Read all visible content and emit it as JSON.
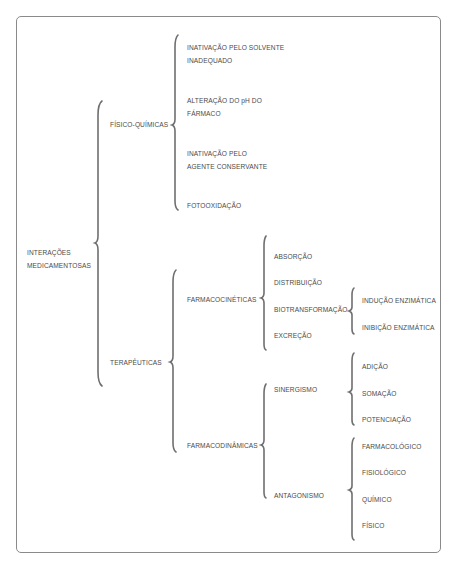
{
  "diagram": {
    "root": {
      "line1": "INTERAÇÕES",
      "line2": "MEDICAMENTOSAS"
    },
    "fisico_quimicas": {
      "label": "FÍSICO-QUÍMICAS",
      "items": [
        {
          "line1": "INATIVAÇÃO PELO SOLVENTE",
          "line2": "INADEQUADO"
        },
        {
          "line1": "ALTERAÇÃO DO pH DO",
          "line2": "FÁRMACO"
        },
        {
          "line1": "INATIVAÇÃO PELO",
          "line2": "AGENTE CONSERVANTE"
        },
        {
          "line1": "FOTOOXIDAÇÃO"
        }
      ]
    },
    "terapeuticas": {
      "label": "TERAPÊUTICAS",
      "farmacocineticas": {
        "label": "FARMACOCINÉTICAS",
        "items": [
          "ABSORÇÃO",
          "DISTRIBUIÇÃO",
          "BIOTRANSFORMAÇÃO",
          "EXCREÇÃO"
        ],
        "biotransformacao_items": [
          "INDUÇÃO ENZIMÁTICA",
          "INIBIÇÃO ENZIMÁTICA"
        ]
      },
      "farmacodinamicas": {
        "label": "FARMACODINÂMICAS",
        "sinergismo": {
          "label": "SINERGISMO",
          "items": [
            "ADIÇÃO",
            "SOMAÇÃO",
            "POTENCIAÇÃO"
          ]
        },
        "antagonismo": {
          "label": "ANTAGONISMO",
          "items": [
            "FARMACOLÓGICO",
            "FISIOLÓGICO",
            "QUÍMICO",
            "FÍSICO"
          ]
        }
      }
    }
  },
  "colors": {
    "text": "#4a4a4a",
    "brace": "#6f6f6f",
    "frame": "#8a8a8a"
  }
}
